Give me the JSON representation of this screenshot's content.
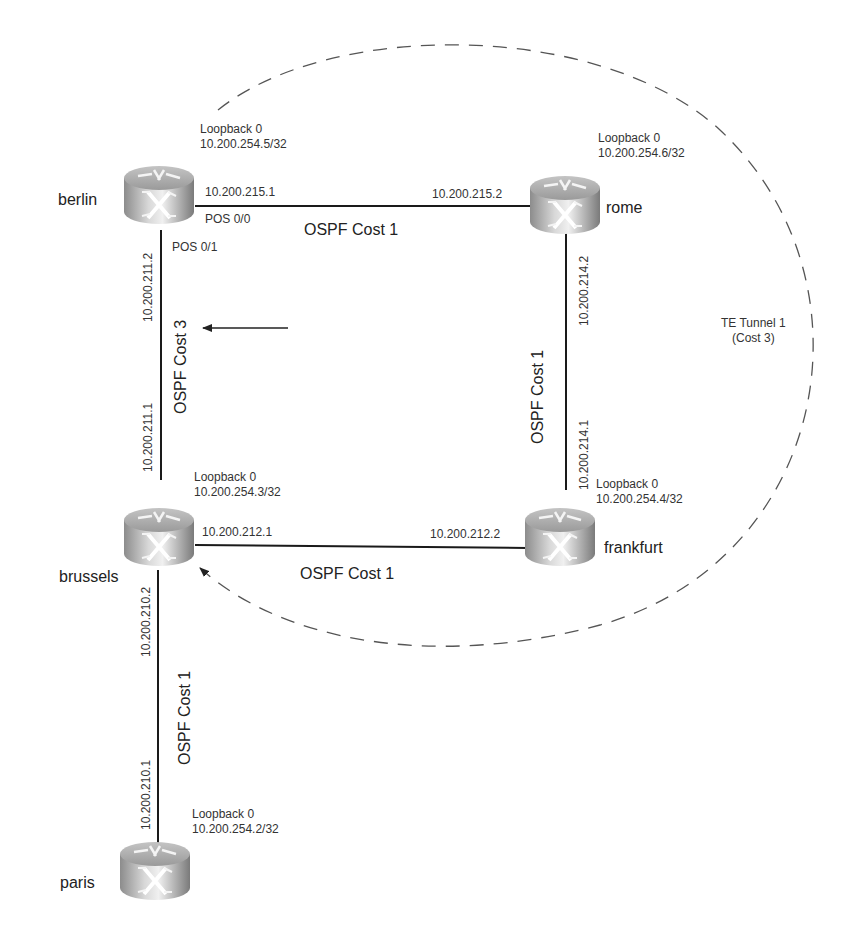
{
  "figure": {
    "routers": [
      {
        "id": "berlin",
        "name": "berlin",
        "loopback_label": "Loopback 0",
        "loopback_ip": "10.200.254.5/32"
      },
      {
        "id": "rome",
        "name": "rome",
        "loopback_label": "Loopback 0",
        "loopback_ip": "10.200.254.6/32"
      },
      {
        "id": "brussels",
        "name": "brussels",
        "loopback_label": "Loopback 0",
        "loopback_ip": "10.200.254.3/32"
      },
      {
        "id": "frankfurt",
        "name": "frankfurt",
        "loopback_label": "Loopback 0",
        "loopback_ip": "10.200.254.4/32"
      },
      {
        "id": "paris",
        "name": "paris",
        "loopback_label": "Loopback 0",
        "loopback_ip": "10.200.254.2/32"
      }
    ],
    "links": [
      {
        "from": "berlin",
        "to": "rome",
        "cost_label": "OSPF Cost 1",
        "a_ip": "10.200.215.1",
        "b_ip": "10.200.215.2",
        "a_interface": "POS 0/0"
      },
      {
        "from": "berlin",
        "to": "brussels",
        "cost_label": "OSPF Cost 3",
        "a_ip": "10.200.211.2",
        "b_ip": "10.200.211.1",
        "a_interface": "POS 0/1"
      },
      {
        "from": "rome",
        "to": "frankfurt",
        "cost_label": "OSPF Cost 1",
        "a_ip": "10.200.214.2",
        "b_ip": "10.200.214.1"
      },
      {
        "from": "brussels",
        "to": "frankfurt",
        "cost_label": "OSPF Cost 1",
        "a_ip": "10.200.212.1",
        "b_ip": "10.200.212.2"
      },
      {
        "from": "brussels",
        "to": "paris",
        "cost_label": "OSPF Cost 1",
        "a_ip": "10.200.210.2",
        "b_ip": "10.200.210.1"
      }
    ],
    "tunnel": {
      "label_line1": "TE Tunnel 1",
      "label_line2": "(Cost 3)",
      "from": "berlin",
      "to": "brussels",
      "style": "dashed"
    },
    "colors": {
      "line": "#1a1a1a",
      "dash": "#555555",
      "text": "#2a2a2a"
    }
  }
}
